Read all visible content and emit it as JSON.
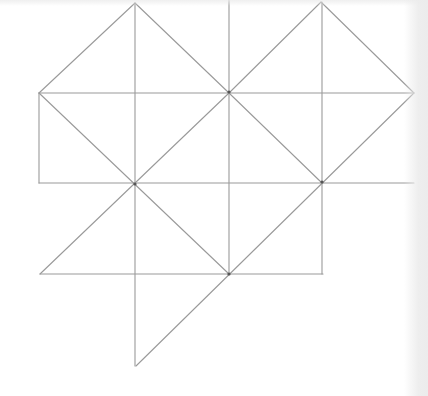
{
  "diagram": {
    "title": "",
    "stroke_color": "#9a9a9a",
    "vertex_color": "#555555",
    "stroke_width": 1.1,
    "segments": [
      {
        "x1": 39,
        "y1": 93,
        "x2": 414,
        "y2": 93
      },
      {
        "x1": 39,
        "y1": 183,
        "x2": 414,
        "y2": 183
      },
      {
        "x1": 40,
        "y1": 274,
        "x2": 323,
        "y2": 274
      },
      {
        "x1": 39,
        "y1": 93,
        "x2": 39,
        "y2": 183
      },
      {
        "x1": 135,
        "y1": 3,
        "x2": 135,
        "y2": 366
      },
      {
        "x1": 229,
        "y1": 0,
        "x2": 229,
        "y2": 274
      },
      {
        "x1": 322,
        "y1": 2,
        "x2": 322,
        "y2": 274
      },
      {
        "x1": 39,
        "y1": 93,
        "x2": 135,
        "y2": 3
      },
      {
        "x1": 135,
        "y1": 3,
        "x2": 229,
        "y2": 93
      },
      {
        "x1": 229,
        "y1": 93,
        "x2": 321,
        "y2": 2
      },
      {
        "x1": 321,
        "y1": 2,
        "x2": 414,
        "y2": 93
      },
      {
        "x1": 39,
        "y1": 93,
        "x2": 229,
        "y2": 274
      },
      {
        "x1": 229,
        "y1": 93,
        "x2": 40,
        "y2": 274
      },
      {
        "x1": 229,
        "y1": 93,
        "x2": 322,
        "y2": 183
      },
      {
        "x1": 414,
        "y1": 93,
        "x2": 136,
        "y2": 366
      }
    ],
    "vertices": [
      {
        "x": 135,
        "y": 184
      },
      {
        "x": 229,
        "y": 92
      },
      {
        "x": 322,
        "y": 182
      },
      {
        "x": 229,
        "y": 274
      }
    ]
  }
}
